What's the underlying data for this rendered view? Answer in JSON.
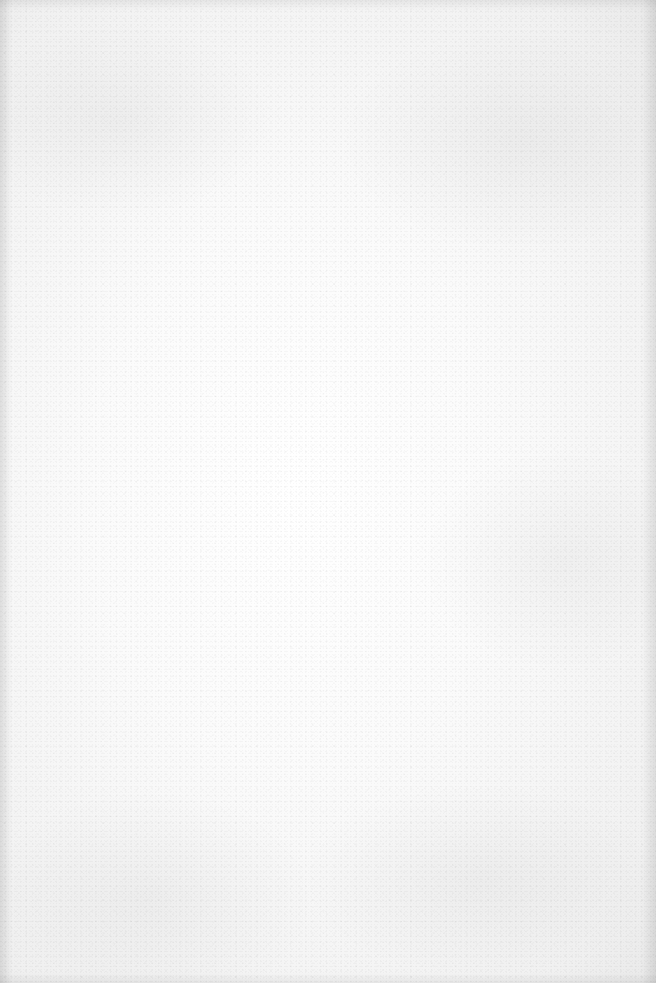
{
  "page": {
    "type": "blank-paper",
    "text_content": [],
    "colors": {
      "paper": "#fbfbfb",
      "edge_shadow": "#e6e6e6"
    }
  }
}
